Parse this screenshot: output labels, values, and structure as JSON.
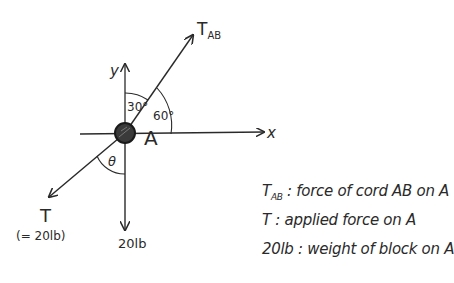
{
  "diagram": {
    "type": "free-body-diagram",
    "point": {
      "label": "A"
    },
    "axes": {
      "x_label": "x",
      "y_label": "y"
    },
    "forces": [
      {
        "id": "tab",
        "label_main": "T",
        "label_sub": "AB",
        "direction": "up-right"
      },
      {
        "id": "t",
        "label_main": "T",
        "label_note": "(= 20lb)",
        "direction": "down-left"
      },
      {
        "id": "weight",
        "label_main": "20lb",
        "direction": "down"
      }
    ],
    "angles": [
      {
        "label": "30°",
        "between": "y-axis and T_AB"
      },
      {
        "label": "60°",
        "between": "T_AB and x-axis"
      },
      {
        "label": "θ",
        "between": "T and negative y-axis"
      }
    ]
  },
  "legend": [
    {
      "symbol_main": "T",
      "symbol_sub": "AB",
      "separator": ":",
      "description": "force of cord AB on A"
    },
    {
      "symbol_main": "T",
      "symbol_sub": "",
      "separator": ":",
      "description": "applied force on A"
    },
    {
      "symbol_main": "20lb",
      "symbol_sub": "",
      "separator": ":",
      "description": "weight of block on A"
    }
  ],
  "colors": {
    "ink": "#2a2a2a",
    "particle": "#3a3a3a",
    "background": "#ffffff"
  }
}
